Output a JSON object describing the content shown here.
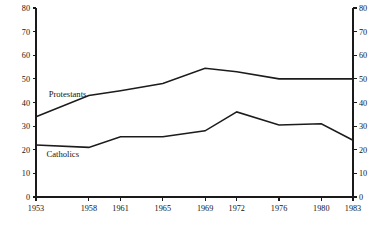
{
  "chart_data": {
    "type": "line",
    "title": "",
    "subtitle": "",
    "xlabel": "",
    "ylabel": "",
    "x": [
      1953,
      1958,
      1961,
      1965,
      1969,
      1972,
      1976,
      1980,
      1983
    ],
    "xtick_labels": [
      "1953",
      "1958",
      "1961",
      "1965",
      "1969",
      "1972",
      "1976",
      "1980",
      "1983"
    ],
    "ylim": [
      0,
      80
    ],
    "yticks": [
      0,
      10,
      20,
      30,
      40,
      50,
      60,
      70,
      80
    ],
    "ytick_labels": [
      "0",
      "10",
      "20",
      "30",
      "40",
      "50",
      "60",
      "70",
      "80"
    ],
    "y_axis_right": true,
    "right_ytick_labels": [
      "0",
      "10",
      "20",
      "30",
      "40",
      "50",
      "60",
      "70",
      "80"
    ],
    "grid": false,
    "legend_position": "inline-annotation",
    "series": [
      {
        "name": "Protestants",
        "label": "Protestants",
        "color": "#1c1c1c",
        "values": [
          34,
          43,
          45,
          48,
          54.5,
          53,
          50,
          50,
          50
        ],
        "label_x": 1954.2,
        "label_y": 42.5
      },
      {
        "name": "Catholics",
        "label": "Catholics",
        "color": "#1c1c1c",
        "values": [
          22,
          21,
          25.5,
          25.5,
          28,
          36,
          30.5,
          31,
          24
        ],
        "label_x": 1954.0,
        "label_y": 17.0
      }
    ],
    "annotations": []
  },
  "colors": {
    "background": "#ffffff",
    "axis": "#1a1a1a",
    "line": "#1c1c1c",
    "text": "#141414"
  }
}
